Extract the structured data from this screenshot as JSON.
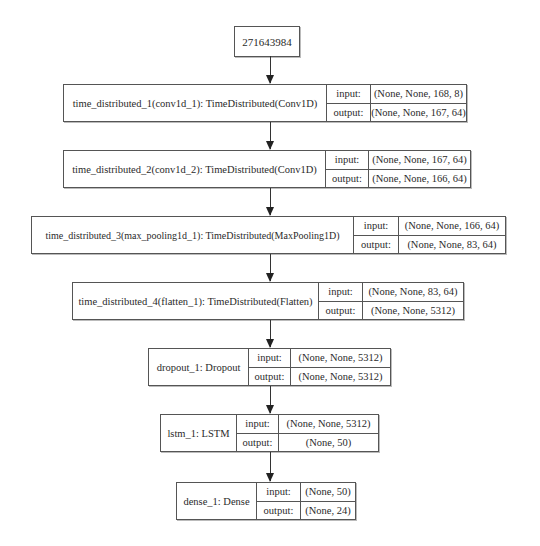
{
  "diagram": {
    "type": "keras-model-plot",
    "input_node": {
      "label": "271643984"
    },
    "io_labels": {
      "input": "input:",
      "output": "output:"
    },
    "layers": [
      {
        "name": "time_distributed_1(conv1d_1): TimeDistributed(Conv1D)",
        "input": "(None, None, 168, 8)",
        "output": "(None, None, 167, 64)"
      },
      {
        "name": "time_distributed_2(conv1d_2): TimeDistributed(Conv1D)",
        "input": "(None, None, 167, 64)",
        "output": "(None, None, 166, 64)"
      },
      {
        "name": "time_distributed_3(max_pooling1d_1): TimeDistributed(MaxPooling1D)",
        "input": "(None, None, 166, 64)",
        "output": "(None, None, 83, 64)"
      },
      {
        "name": "time_distributed_4(flatten_1): TimeDistributed(Flatten)",
        "input": "(None, None, 83, 64)",
        "output": "(None, None, 5312)"
      },
      {
        "name": "dropout_1: Dropout",
        "input": "(None, None, 5312)",
        "output": "(None, None, 5312)"
      },
      {
        "name": "lstm_1: LSTM",
        "input": "(None, None, 5312)",
        "output": "(None, 50)"
      },
      {
        "name": "dense_1: Dense",
        "input": "(None, 50)",
        "output": "(None, 24)"
      }
    ],
    "colors": {
      "border": "#555555",
      "text": "#2a2a2a",
      "arrow": "#222222",
      "background": "#ffffff"
    }
  }
}
